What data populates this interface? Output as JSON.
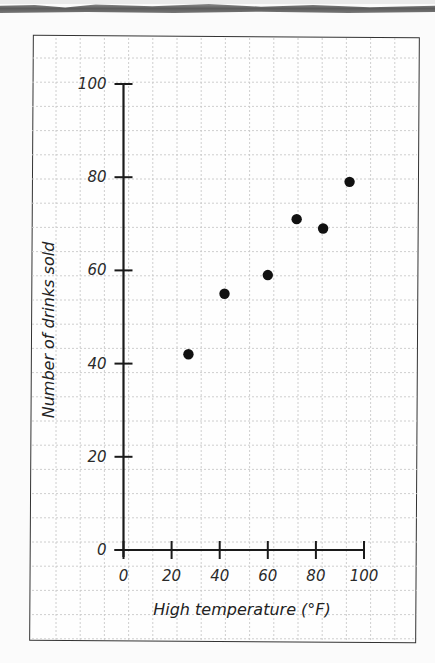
{
  "chart_data": {
    "type": "scatter",
    "title": "",
    "xlabel": "High temperature (°F)",
    "ylabel": "Number of drinks sold",
    "xlim": [
      0,
      100
    ],
    "ylim": [
      0,
      100
    ],
    "x_ticks": [
      0,
      20,
      40,
      60,
      80,
      100
    ],
    "y_ticks": [
      0,
      20,
      40,
      60,
      80,
      100
    ],
    "x_tick_labels": [
      "0",
      "20",
      "40",
      "60",
      "80",
      "100"
    ],
    "y_tick_labels": [
      "0",
      "20",
      "40",
      "60",
      "80",
      "100"
    ],
    "grid": true,
    "legend": null,
    "series": [
      {
        "name": "drinks sold",
        "points": [
          {
            "x": 27,
            "y": 42
          },
          {
            "x": 42,
            "y": 55
          },
          {
            "x": 60,
            "y": 59
          },
          {
            "x": 72,
            "y": 71
          },
          {
            "x": 83,
            "y": 69
          },
          {
            "x": 94,
            "y": 79
          }
        ],
        "color": "#111111"
      }
    ]
  },
  "style": {
    "point_color": "#111111",
    "axis_color": "#1a1a1a",
    "grid_color": "#c8c8c8",
    "frame_color": "#333333"
  }
}
